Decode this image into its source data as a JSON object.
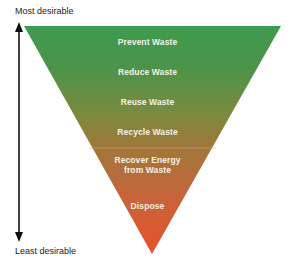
{
  "axis": {
    "top_label": "Most desirable",
    "bottom_label": "Least desirable"
  },
  "levels": [
    {
      "label": "Prevent Waste"
    },
    {
      "label": "Reduce Waste"
    },
    {
      "label": "Reuse Waste"
    },
    {
      "label": "Recycle Waste"
    },
    {
      "label": "Recover Energy from Waste",
      "line1": "Recover Energy",
      "line2": "from Waste"
    },
    {
      "label": "Dispose"
    }
  ],
  "colors": {
    "top_green": "#3f9a4e",
    "mid_brown": "#9a7a3c",
    "bottom_orange": "#e0562c",
    "text": "#f4f1e6",
    "arrow": "#111111"
  }
}
